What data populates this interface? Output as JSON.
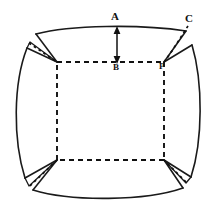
{
  "figure": {
    "kind": "geometric-unfolding-diagram",
    "background_color": "#ffffff",
    "line_color": "#1a1a1a",
    "labels": [
      {
        "id": "A",
        "text": "A",
        "x": 117,
        "y": 17
      },
      {
        "id": "B",
        "text": "B",
        "x": 117,
        "y": 68
      },
      {
        "id": "C",
        "text": "C",
        "x": 190,
        "y": 19
      },
      {
        "id": "P",
        "text": "P",
        "x": 163,
        "y": 67
      }
    ],
    "dimension_arrow": {
      "name": "A-to-B",
      "from_label": "A",
      "to_label": "B",
      "x": 117,
      "y_top": 28,
      "y_bottom": 62,
      "double_headed": true
    },
    "inner_square": {
      "left": 57,
      "top": 62,
      "right": 164,
      "bottom": 160,
      "style": "dashed"
    }
  }
}
